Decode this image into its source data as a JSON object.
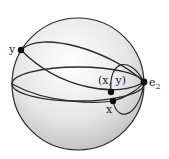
{
  "diagram": {
    "type": "sphere-with-great-circles",
    "labels": {
      "y": "y",
      "xy": "(x, y)",
      "x": "x",
      "e2": "e",
      "e2_sub": "2"
    },
    "colors": {
      "stroke": "#2a2a2a",
      "shade_light": "#ffffff",
      "shade_dark": "#bdbdbd",
      "point": "#111111"
    }
  }
}
